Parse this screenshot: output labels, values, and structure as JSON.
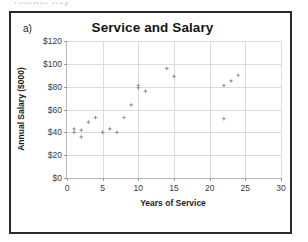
{
  "page": {
    "cutoff_header_text": "Answer Key",
    "panel_label": "a)"
  },
  "chart_data": {
    "type": "scatter",
    "title": "Service and Salary",
    "xlabel": "Years of Service",
    "ylabel": "Annual Salary ($000)",
    "xlim": [
      0,
      30
    ],
    "ylim": [
      0,
      120
    ],
    "xticks": [
      0,
      5,
      10,
      15,
      20,
      25,
      30
    ],
    "yticks": [
      0,
      20,
      40,
      60,
      80,
      100,
      120
    ],
    "xtick_labels": [
      "0",
      "5",
      "10",
      "15",
      "20",
      "25",
      "30"
    ],
    "ytick_labels": [
      "$0",
      "$20",
      "$40",
      "$60",
      "$80",
      "$100",
      "$120"
    ],
    "grid": true,
    "legend": "none",
    "marker_color": "#8c8c8c",
    "marker_shape": "diamond-star",
    "series": [
      {
        "name": "Employees",
        "points": [
          {
            "x": 1,
            "y": 43
          },
          {
            "x": 1,
            "y": 40
          },
          {
            "x": 2,
            "y": 42
          },
          {
            "x": 2,
            "y": 36
          },
          {
            "x": 3,
            "y": 49
          },
          {
            "x": 4,
            "y": 53
          },
          {
            "x": 5,
            "y": 40
          },
          {
            "x": 6,
            "y": 43
          },
          {
            "x": 7,
            "y": 40
          },
          {
            "x": 8,
            "y": 53
          },
          {
            "x": 9,
            "y": 64
          },
          {
            "x": 10,
            "y": 81
          },
          {
            "x": 10,
            "y": 79
          },
          {
            "x": 11,
            "y": 76
          },
          {
            "x": 14,
            "y": 96
          },
          {
            "x": 15,
            "y": 89
          },
          {
            "x": 22,
            "y": 81
          },
          {
            "x": 22,
            "y": 52
          },
          {
            "x": 23,
            "y": 85
          },
          {
            "x": 24,
            "y": 90
          }
        ]
      }
    ]
  }
}
